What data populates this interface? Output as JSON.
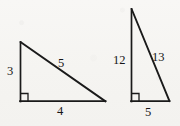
{
  "figure": {
    "background_color": "#f7f6f4",
    "stroke_color": "#1a1a1a",
    "text_color": "#161616"
  },
  "triangles": [
    {
      "id": "triangle-3-4-5",
      "name": "left-triangle",
      "right_angle": "bottom-left",
      "vertices": {
        "apex": [
          20,
          42
        ],
        "right_angle_corner": [
          20,
          101
        ],
        "base_end": [
          105,
          101
        ]
      },
      "labels": {
        "vertical_leg": "3",
        "hypotenuse": "5",
        "horizontal_leg": "4"
      }
    },
    {
      "id": "triangle-12-5-13",
      "name": "right-triangle",
      "right_angle": "bottom-left",
      "vertices": {
        "apex": [
          131,
          9
        ],
        "right_angle_corner": [
          131,
          101
        ],
        "base_end": [
          169,
          101
        ]
      },
      "labels": {
        "vertical_leg": "12",
        "hypotenuse": "13",
        "horizontal_leg": "5"
      }
    }
  ],
  "marks": {
    "right_angle_symbol": "square-corner-mark"
  }
}
